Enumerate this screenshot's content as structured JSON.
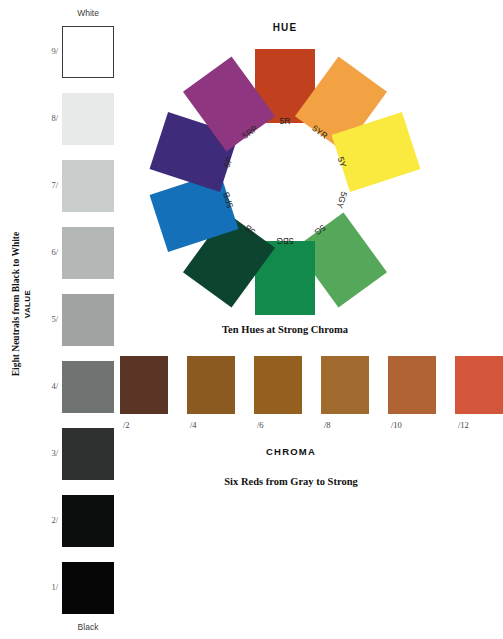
{
  "value_scale": {
    "axis_caption": "Eight Neutrals from Black to White",
    "axis_sub_caption": "VALUE",
    "top_label": "White",
    "bottom_label": "Black",
    "steps": [
      {
        "label": "9/",
        "color": "#ffffff",
        "top": 26,
        "height": 52,
        "outlined": true
      },
      {
        "label": "8/",
        "color": "#e8eae9",
        "top": 93,
        "height": 52,
        "outlined": false
      },
      {
        "label": "7/",
        "color": "#c9cdcc",
        "top": 160,
        "height": 52,
        "outlined": false
      },
      {
        "label": "6/",
        "color": "#b3b8b7",
        "top": 227,
        "height": 52,
        "outlined": false
      },
      {
        "label": "5/",
        "color": "#9fa3a2",
        "top": 294,
        "height": 52,
        "outlined": false
      },
      {
        "label": "4/",
        "color": "#6f7372",
        "top": 361,
        "height": 52,
        "outlined": false
      },
      {
        "label": "3/",
        "color": "#2e3130",
        "top": 428,
        "height": 52,
        "outlined": false
      },
      {
        "label": "2/",
        "color": "#0c0d0d",
        "top": 495,
        "height": 52,
        "outlined": false
      },
      {
        "label": "1/",
        "color": "#060606",
        "top": 562,
        "height": 52,
        "outlined": false
      }
    ]
  },
  "hue_wheel": {
    "title": "HUE",
    "caption": "Ten Hues at Strong Chroma",
    "tiles": [
      {
        "label": "5R",
        "color": "#c1411f",
        "angle": 0,
        "radius": 96,
        "rotate": 0
      },
      {
        "label": "5YR",
        "color": "#f2a243",
        "angle": 36,
        "radius": 96,
        "rotate": 36
      },
      {
        "label": "5Y",
        "color": "#fae93f",
        "angle": 72,
        "radius": 96,
        "rotate": 72
      },
      {
        "label": "5GY",
        "color": "#92c champion",
        "angle": 108,
        "radius": 96,
        "rotate": 108
      },
      {
        "label": "5G",
        "color": "#55a75a",
        "angle": 144,
        "radius": 96,
        "rotate": 144
      },
      {
        "label": "5BG",
        "color": "#128a4b",
        "angle": 180,
        "radius": 96,
        "rotate": 180
      },
      {
        "label": "5B",
        "color": "#0c4430",
        "angle": 216,
        "radius": 96,
        "rotate": 216
      },
      {
        "label": "5PB",
        "color": "#1470b8",
        "angle": 252,
        "radius": 96,
        "rotate": 252
      },
      {
        "label": "5P",
        "color": "#3e2b7a",
        "angle": 288,
        "radius": 96,
        "rotate": 288
      },
      {
        "label": "5RP",
        "color": "#8e3780",
        "angle": 324,
        "radius": 96,
        "rotate": 324
      }
    ],
    "label_radius": 60
  },
  "chroma_scale": {
    "title": "CHROMA",
    "caption": "Six Reds from Gray to Strong",
    "steps": [
      {
        "label": "/2",
        "color": "#5a3424",
        "left": 10
      },
      {
        "label": "/4",
        "color": "#8a5a20",
        "left": 77
      },
      {
        "label": "/6",
        "color": "#94601f",
        "left": 144
      },
      {
        "label": "/8",
        "color": "#a06a2e",
        "left": 211
      },
      {
        "label": "/10",
        "color": "#b06436",
        "left": 278
      },
      {
        "label": "/12",
        "color": "#d4563a",
        "left": 345
      }
    ]
  }
}
